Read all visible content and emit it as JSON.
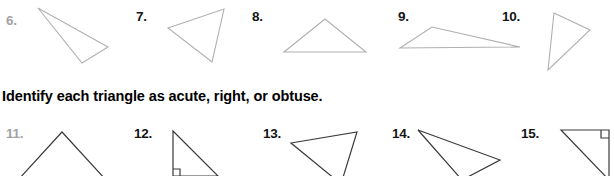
{
  "worksheet": {
    "instruction": "Identify each triangle as acute, right, or obtuse.",
    "colors": {
      "page_background": "#ffffff",
      "stroke_light": "#b0b0b0",
      "stroke_dark": "#3a3a3a",
      "number_gray": "#a3a3a3",
      "number_dark": "#151515",
      "instruction_text": "#000000"
    },
    "rows": [
      {
        "row_id": "row-top",
        "problems": [
          {
            "number": "6.",
            "number_style": "gray",
            "stroke": "light",
            "shape": "triangle",
            "points": "38,8 108,47 82,63",
            "classification": "obtuse"
          },
          {
            "number": "7.",
            "number_style": "dark",
            "stroke": "light",
            "shape": "triangle",
            "points": "168,28 224,9 212,62",
            "classification": "acute"
          },
          {
            "number": "8.",
            "number_style": "dark",
            "stroke": "light",
            "shape": "triangle",
            "points": "284,52 325,19 366,52",
            "classification": "acute"
          },
          {
            "number": "9.",
            "number_style": "dark",
            "stroke": "light",
            "shape": "triangle",
            "points": "400,48 432,27 520,47",
            "classification": "obtuse"
          },
          {
            "number": "10.",
            "number_style": "dark",
            "stroke": "light",
            "shape": "triangle",
            "points": "554,13 590,30 548,70",
            "classification": "acute"
          }
        ]
      },
      {
        "row_id": "row-bottom",
        "problems": [
          {
            "number": "11.",
            "number_style": "gray",
            "stroke": "dark",
            "shape": "triangle",
            "points": "62,14 18,62 106,62",
            "classification": "acute",
            "clipped": "bottom"
          },
          {
            "number": "12.",
            "number_style": "dark",
            "stroke": "dark",
            "shape": "right-triangle",
            "points": "173,13 173,58 218,58",
            "right_angle_marker": "173,58",
            "right_angle_orientation": "bottom-left",
            "classification": "right",
            "clipped": "bottom"
          },
          {
            "number": "13.",
            "number_style": "dark",
            "stroke": "dark",
            "shape": "triangle",
            "points": "291,25 357,14 341,66",
            "classification": "acute",
            "clipped": "bottom"
          },
          {
            "number": "14.",
            "number_style": "dark",
            "stroke": "dark",
            "shape": "triangle",
            "points": "418,12 500,42 462,62",
            "classification": "obtuse",
            "clipped": "bottom"
          },
          {
            "number": "15.",
            "number_style": "dark",
            "stroke": "dark",
            "shape": "right-triangle",
            "points": "561,12 609,12 609,62",
            "right_angle_marker": "609,12",
            "right_angle_orientation": "top-right",
            "classification": "right",
            "clipped": "bottom"
          }
        ]
      }
    ]
  }
}
